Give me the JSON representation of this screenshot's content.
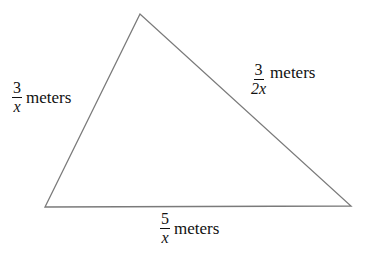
{
  "diagram": {
    "shape": "triangle",
    "stroke_color": "#7a7a7a",
    "vertices": {
      "top": [
        140,
        14
      ],
      "bottom_left": [
        45,
        207
      ],
      "bottom_right": [
        351,
        206
      ]
    },
    "sides": {
      "left": {
        "numerator": "3",
        "denominator": "x",
        "unit": "meters"
      },
      "right": {
        "numerator": "3",
        "denominator": "2x",
        "unit": "meters"
      },
      "bottom": {
        "numerator": "5",
        "denominator": "x",
        "unit": "meters"
      }
    }
  }
}
